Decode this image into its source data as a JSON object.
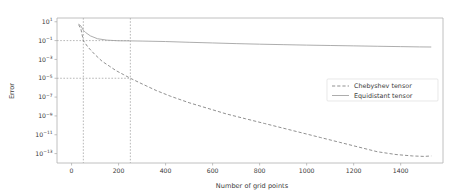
{
  "chart_data": {
    "type": "line",
    "title": "",
    "xlabel": "Number of grid points",
    "ylabel": "Error",
    "xlim": [
      -62,
      1580
    ],
    "ylim_log10": [
      -14,
      1.4
    ],
    "xticks": [
      0,
      200,
      400,
      600,
      800,
      1000,
      1200,
      1400
    ],
    "xtick_labels": [
      "0",
      "200",
      "400",
      "600",
      "800",
      "1000",
      "1200",
      "1400"
    ],
    "yticks_log10": [
      1,
      -1,
      -3,
      -5,
      -7,
      -9,
      -11,
      -13
    ],
    "ytick_labels": [
      "10¹",
      "10⁻¹",
      "10⁻³",
      "10⁻⁵",
      "10⁻⁷",
      "10⁻⁹",
      "10⁻¹¹",
      "10⁻¹³"
    ],
    "ytick_mantissa": "10",
    "ytick_exponents": [
      "1",
      "-1",
      "-3",
      "-5",
      "-7",
      "-9",
      "-11",
      "-13"
    ],
    "grid": false,
    "legend_position": "center-right",
    "annotations": {
      "guide_lines": [
        {
          "type": "vertical",
          "x": 50,
          "label": "n=50 marker"
        },
        {
          "type": "vertical",
          "x": 250,
          "label": "n=250 marker"
        },
        {
          "type": "horizontal",
          "y_log10": -1,
          "label": "error 1e-1 marker"
        },
        {
          "type": "horizontal",
          "y_log10": -5,
          "label": "error 1e-5 marker"
        }
      ]
    },
    "series": [
      {
        "name": "Chebyshev tensor",
        "style": "dashed",
        "color": "#7d7d7d",
        "x": [
          30,
          40,
          50,
          70,
          100,
          130,
          160,
          190,
          220,
          250,
          300,
          360,
          420,
          500,
          580,
          660,
          740,
          820,
          900,
          980,
          1060,
          1140,
          1220,
          1300,
          1380,
          1450,
          1500,
          1530
        ],
        "y_log10": [
          0.7,
          0.2,
          -1.0,
          -1.7,
          -2.5,
          -3.2,
          -3.7,
          -4.2,
          -4.6,
          -5.0,
          -5.6,
          -6.3,
          -6.9,
          -7.6,
          -8.2,
          -8.8,
          -9.3,
          -9.8,
          -10.3,
          -10.8,
          -11.3,
          -11.8,
          -12.3,
          -12.8,
          -13.1,
          -13.25,
          -13.3,
          -13.25
        ]
      },
      {
        "name": "Equidistant tensor",
        "style": "solid",
        "color": "#9e9e9e",
        "x": [
          30,
          40,
          50,
          60,
          80,
          110,
          150,
          200,
          250,
          300,
          400,
          500,
          600,
          700,
          800,
          900,
          1000,
          1100,
          1200,
          1300,
          1400,
          1480,
          1530
        ],
        "y_log10": [
          0.75,
          0.55,
          0.1,
          -0.15,
          -0.5,
          -0.8,
          -0.95,
          -1.02,
          -1.03,
          -1.05,
          -1.1,
          -1.18,
          -1.25,
          -1.32,
          -1.38,
          -1.43,
          -1.48,
          -1.52,
          -1.56,
          -1.6,
          -1.64,
          -1.67,
          -1.68
        ]
      }
    ],
    "legend": [
      {
        "label": "Chebyshev tensor",
        "style": "dashed"
      },
      {
        "label": "Equidistant tensor",
        "style": "solid"
      }
    ]
  }
}
